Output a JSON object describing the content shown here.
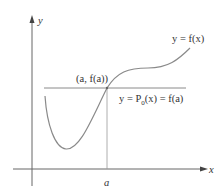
{
  "figure": {
    "axes": {
      "x_label": "x",
      "y_label": "y"
    },
    "point": {
      "label": "(a, f(a))"
    },
    "tick": {
      "label": "a"
    },
    "curve": {
      "label": "y = f(x)"
    },
    "tangent_line": {
      "label_prefix": "y = P",
      "label_subscript": "0",
      "label_suffix": "(x) = f(a)"
    },
    "colors": {
      "axis": "#555555",
      "curve": "#8a8a8a",
      "line": "#8a8a8a",
      "text": "#333333"
    }
  }
}
